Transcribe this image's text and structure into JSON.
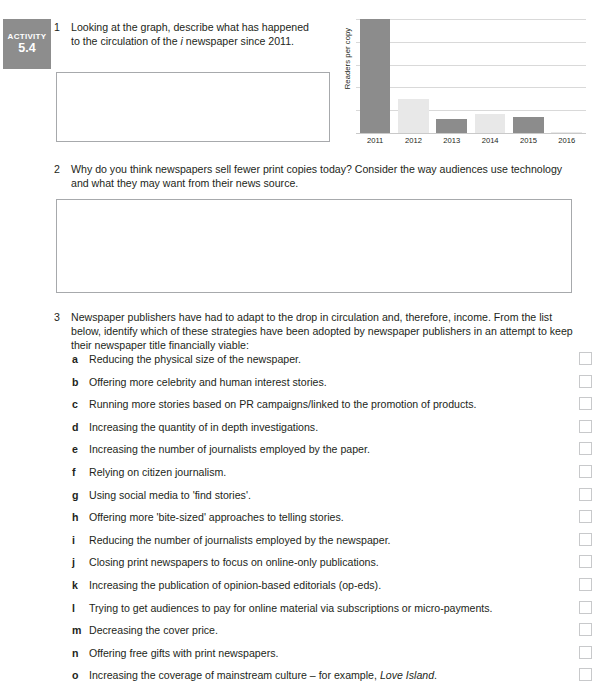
{
  "badge": {
    "word": "ACTIVITY",
    "number": "5.4"
  },
  "questions": [
    {
      "number": "1",
      "text_before_italic": "Looking at the graph, describe what has happened to the circulation of the ",
      "italic": "i",
      "text_after_italic": " newspaper since 2011.",
      "full_text": "Looking at the graph, describe what has happened to the circulation of the i newspaper since 2011."
    },
    {
      "number": "2",
      "full_text": "Why do you think newspapers sell fewer print copies today? Consider the way audiences use technology and what they may want from their news source."
    },
    {
      "number": "3",
      "full_text": "Newspaper publishers have had to adapt to the drop in circulation and, therefore, income. From the list below, identify which of these strategies have been adopted by newspaper publishers in an attempt to keep their newspaper title financially viable:"
    }
  ],
  "answer_boxes": [
    {
      "name": "answer-box-1",
      "placeholder": ""
    },
    {
      "name": "answer-box-2",
      "placeholder": ""
    }
  ],
  "strategy_list": [
    {
      "letter": "a",
      "text": "Reducing the physical size of the newspaper."
    },
    {
      "letter": "b",
      "text": "Offering more celebrity and human interest stories."
    },
    {
      "letter": "c",
      "text": "Running more stories based on PR campaigns/linked to the promotion of products."
    },
    {
      "letter": "d",
      "text": "Increasing the quantity of in depth investigations."
    },
    {
      "letter": "e",
      "text": "Increasing the number of journalists employed by the paper."
    },
    {
      "letter": "f",
      "text": "Relying on citizen journalism."
    },
    {
      "letter": "g",
      "text": "Using social media to 'find stories'."
    },
    {
      "letter": "h",
      "text": "Offering more 'bite-sized' approaches to telling stories."
    },
    {
      "letter": "i",
      "text": "Reducing the number of journalists employed by the newspaper."
    },
    {
      "letter": "j",
      "text": "Closing print newspapers to focus on online-only publications."
    },
    {
      "letter": "k",
      "text": "Increasing the publication of opinion-based editorials (op-eds)."
    },
    {
      "letter": "l",
      "text": "Trying to get audiences to pay for online material via subscriptions or micro-payments."
    },
    {
      "letter": "m",
      "text": "Decreasing the cover price."
    },
    {
      "letter": "n",
      "text": "Offering free gifts with print newspapers."
    },
    {
      "letter": "o",
      "text_before_italic": "Increasing the coverage of mainstream culture – for example, ",
      "italic": "Love Island",
      "text_after_italic": ".",
      "text": "Increasing the coverage of mainstream culture – for example, Love Island."
    }
  ],
  "chart_data": {
    "type": "bar",
    "title": "",
    "xlabel": "",
    "ylabel": "Readers per copy",
    "categories": [
      "2011",
      "2012",
      "2013",
      "2014",
      "2015",
      "2016"
    ],
    "values": [
      5.0,
      1.5,
      0.6,
      0.85,
      0.7,
      0.05
    ],
    "ylim": [
      0,
      5
    ],
    "yticks": [
      0,
      1,
      2,
      3,
      4,
      5
    ],
    "ytick_labels": [],
    "grid": true,
    "legend": false,
    "bar_colors": [
      "#8c8c8c",
      "#e8e8e8",
      "#8c8c8c",
      "#e8e8e8",
      "#8c8c8c",
      "#e8e8e8"
    ],
    "gridline_color": "#d9d9d9"
  },
  "colors": {
    "badge_bg": "#8d8d8d",
    "text": "#231f20",
    "box_border": "#a7a9ac",
    "checkbox_border": "#c8c9cb",
    "bar_dark": "#8c8c8c",
    "bar_light": "#e8e8e8"
  }
}
